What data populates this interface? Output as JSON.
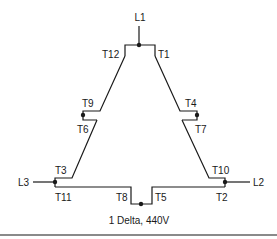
{
  "diagram": {
    "type": "motor winding connection",
    "caption": "1 Delta, 440V",
    "lines": {
      "l1": "L1",
      "l2": "L2",
      "l3": "L3"
    },
    "terminals": {
      "t1": "T1",
      "t2": "T2",
      "t3": "T3",
      "t4": "T4",
      "t5": "T5",
      "t6": "T6",
      "t7": "T7",
      "t8": "T8",
      "t9": "T9",
      "t10": "T10",
      "t11": "T11",
      "t12": "T12"
    },
    "connections": [
      {
        "line": "L1",
        "terminals": [
          "T1",
          "T12"
        ]
      },
      {
        "line": "L2",
        "terminals": [
          "T2",
          "T10"
        ]
      },
      {
        "line": "L3",
        "terminals": [
          "T3",
          "T11"
        ]
      },
      {
        "line": null,
        "terminals": [
          "T4",
          "T7"
        ]
      },
      {
        "line": null,
        "terminals": [
          "T5",
          "T8"
        ]
      },
      {
        "line": null,
        "terminals": [
          "T6",
          "T9"
        ]
      }
    ]
  }
}
